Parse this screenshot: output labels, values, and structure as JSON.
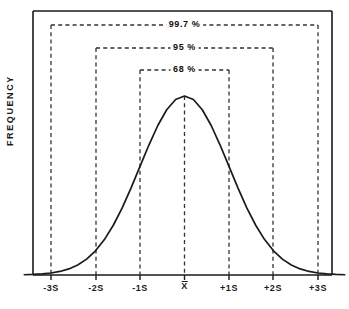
{
  "chart_data": {
    "type": "line",
    "title": "",
    "xlabel": "",
    "ylabel": "FREQUENCY",
    "grid": false,
    "legend": "none",
    "curve": "normal-distribution-bell-curve",
    "x_tick_labels": [
      "-3S",
      "-2S",
      "-1S",
      "X",
      "+1S",
      "+2S",
      "+3S"
    ],
    "x_tick_positions": [
      -3,
      -2,
      -1,
      0,
      1,
      2,
      3
    ],
    "mean_symbol": "X",
    "mean_has_overbar": true,
    "xlim": [
      -3.6,
      3.6
    ],
    "ylim": [
      0,
      1.18
    ],
    "x": [
      -3.6,
      -3.4,
      -3.2,
      -3.0,
      -2.8,
      -2.6,
      -2.4,
      -2.2,
      -2.0,
      -1.8,
      -1.6,
      -1.4,
      -1.2,
      -1.0,
      -0.8,
      -0.6,
      -0.4,
      -0.2,
      0.0,
      0.2,
      0.4,
      0.6,
      0.8,
      1.0,
      1.2,
      1.4,
      1.6,
      1.8,
      2.0,
      2.2,
      2.4,
      2.6,
      2.8,
      3.0,
      3.2,
      3.4,
      3.6
    ],
    "y": [
      0.0015,
      0.0032,
      0.0063,
      0.0111,
      0.0198,
      0.034,
      0.0561,
      0.0889,
      0.1353,
      0.1979,
      0.278,
      0.3753,
      0.4868,
      0.6065,
      0.7261,
      0.8353,
      0.9231,
      0.9802,
      1.0,
      0.9802,
      0.9231,
      0.8353,
      0.7261,
      0.6065,
      0.4868,
      0.3753,
      0.278,
      0.1979,
      0.1353,
      0.0889,
      0.0561,
      0.034,
      0.0198,
      0.0111,
      0.0063,
      0.0032,
      0.0015
    ],
    "brackets": [
      {
        "label": "99.7 %",
        "from": -3,
        "to": 3,
        "level": 1.12,
        "sigma": 3
      },
      {
        "label": "95 %",
        "from": -2,
        "to": 2,
        "level": 0.99,
        "sigma": 2
      },
      {
        "label": "68 %",
        "from": -1,
        "to": 1,
        "level": 0.865,
        "sigma": 1
      }
    ],
    "colors": {
      "curve": "#1a1a1a",
      "axis": "#1a1a1a",
      "dashed": "#333333",
      "background": "#ffffff",
      "text": "#1a1a1a"
    }
  },
  "axis": {
    "y_label": "FREQUENCY"
  },
  "ticks": {
    "minus3s": "-3S",
    "minus2s": "-2S",
    "minus1s": "-1S",
    "mean": "X",
    "plus1s": "+1S",
    "plus2s": "+2S",
    "plus3s": "+3S"
  },
  "brackets": {
    "outer": "99.7 %",
    "middle": "95 %",
    "inner": "68 %"
  }
}
